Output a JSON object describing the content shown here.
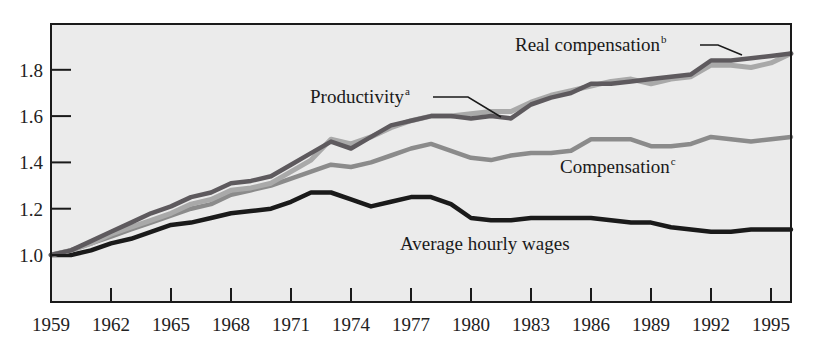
{
  "chart_data": {
    "type": "line",
    "title": "",
    "xlabel": "",
    "ylabel": "",
    "xlim": [
      1959,
      1996
    ],
    "ylim": [
      0.8,
      2.0
    ],
    "grid": false,
    "legend_position": "inline-labels",
    "x_ticks": [
      1959,
      1962,
      1965,
      1968,
      1971,
      1974,
      1977,
      1980,
      1983,
      1986,
      1989,
      1992,
      1995
    ],
    "x_tick_labels": [
      "1959",
      "1962",
      "1965",
      "1968",
      "1971",
      "1974",
      "1977",
      "1980",
      "1983",
      "1986",
      "1989",
      "1992",
      "1995"
    ],
    "y_ticks": [
      1.0,
      1.2,
      1.4,
      1.6,
      1.8
    ],
    "y_tick_labels": [
      "1.0",
      "1.2",
      "1.4",
      "1.6",
      "1.8"
    ],
    "x": [
      1959,
      1960,
      1961,
      1962,
      1963,
      1964,
      1965,
      1966,
      1967,
      1968,
      1969,
      1970,
      1971,
      1972,
      1973,
      1974,
      1975,
      1976,
      1977,
      1978,
      1979,
      1980,
      1981,
      1982,
      1983,
      1984,
      1985,
      1986,
      1987,
      1988,
      1989,
      1990,
      1991,
      1992,
      1993,
      1994,
      1995,
      1996
    ],
    "series": [
      {
        "name": "Productivity",
        "superscript": "a",
        "color": "#a9a9a9",
        "values": [
          1.0,
          1.02,
          1.05,
          1.09,
          1.12,
          1.15,
          1.18,
          1.22,
          1.24,
          1.28,
          1.29,
          1.31,
          1.36,
          1.41,
          1.5,
          1.48,
          1.51,
          1.55,
          1.58,
          1.6,
          1.6,
          1.61,
          1.62,
          1.62,
          1.66,
          1.69,
          1.71,
          1.73,
          1.75,
          1.76,
          1.74,
          1.76,
          1.77,
          1.82,
          1.82,
          1.81,
          1.83,
          1.87
        ]
      },
      {
        "name": "Real compensation",
        "superscript": "b",
        "color": "#5e5a5e",
        "values": [
          1.0,
          1.02,
          1.06,
          1.1,
          1.14,
          1.18,
          1.21,
          1.25,
          1.27,
          1.31,
          1.32,
          1.34,
          1.39,
          1.44,
          1.49,
          1.46,
          1.51,
          1.56,
          1.58,
          1.6,
          1.6,
          1.59,
          1.6,
          1.59,
          1.65,
          1.68,
          1.7,
          1.74,
          1.74,
          1.75,
          1.76,
          1.77,
          1.78,
          1.84,
          1.84,
          1.85,
          1.86,
          1.87
        ]
      },
      {
        "name": "Compensation",
        "superscript": "c",
        "color": "#8b8b8b",
        "values": [
          1.0,
          1.02,
          1.05,
          1.08,
          1.11,
          1.14,
          1.17,
          1.2,
          1.22,
          1.26,
          1.28,
          1.3,
          1.33,
          1.36,
          1.39,
          1.38,
          1.4,
          1.43,
          1.46,
          1.48,
          1.45,
          1.42,
          1.41,
          1.43,
          1.44,
          1.44,
          1.45,
          1.5,
          1.5,
          1.5,
          1.47,
          1.47,
          1.48,
          1.51,
          1.5,
          1.49,
          1.5,
          1.51
        ]
      },
      {
        "name": "Average hourly wages",
        "superscript": "",
        "color": "#1a1a1a",
        "values": [
          1.0,
          1.0,
          1.02,
          1.05,
          1.07,
          1.1,
          1.13,
          1.14,
          1.16,
          1.18,
          1.19,
          1.2,
          1.23,
          1.27,
          1.27,
          1.24,
          1.21,
          1.23,
          1.25,
          1.25,
          1.22,
          1.16,
          1.15,
          1.15,
          1.16,
          1.16,
          1.16,
          1.16,
          1.15,
          1.14,
          1.14,
          1.12,
          1.11,
          1.1,
          1.1,
          1.11,
          1.11,
          1.11
        ]
      }
    ],
    "annotations": [
      {
        "text": "Productivity",
        "superscript": "a",
        "x": 310,
        "y": 103,
        "leader": [
          [
            433,
            97
          ],
          [
            468,
            97
          ],
          [
            501,
            117
          ]
        ]
      },
      {
        "text": "Real compensation",
        "superscript": "b",
        "x": 515,
        "y": 51,
        "leader": [
          [
            700,
            45
          ],
          [
            718,
            45
          ],
          [
            742,
            55
          ]
        ]
      },
      {
        "text": "Compensation",
        "superscript": "c",
        "x": 560,
        "y": 173,
        "leader": []
      },
      {
        "text": "Average hourly wages",
        "superscript": "",
        "x": 400,
        "y": 250,
        "leader": []
      }
    ]
  },
  "style": {
    "plot_background": "#ebebeb",
    "axis_color": "#1a1a1a"
  }
}
